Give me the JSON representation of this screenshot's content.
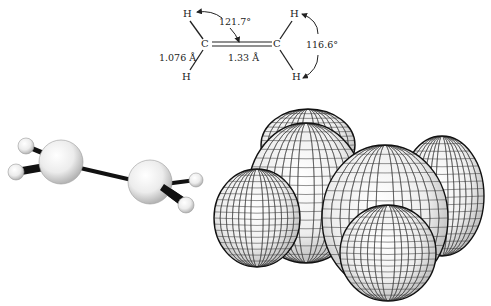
{
  "structural_formula": {
    "atoms": [
      {
        "id": "H1",
        "symbol": "H",
        "x": 183,
        "y": 9
      },
      {
        "id": "C1",
        "symbol": "C",
        "x": 201,
        "y": 39
      },
      {
        "id": "H2",
        "symbol": "H",
        "x": 182,
        "y": 72
      },
      {
        "id": "C2",
        "symbol": "C",
        "x": 273,
        "y": 39
      },
      {
        "id": "H3",
        "symbol": "H",
        "x": 290,
        "y": 9
      },
      {
        "id": "H4",
        "symbol": "H",
        "x": 292,
        "y": 72
      }
    ],
    "bond_angle_h_c_c": "121.7°",
    "bond_angle_h_c_h": "116.6°",
    "ch_bond_length": "1.076 Å",
    "cc_bond_length": "1.33 Å"
  },
  "ball_and_stick": {
    "carbons": [
      {
        "cx": 61,
        "cy": 162,
        "r": 22
      },
      {
        "cx": 150,
        "cy": 182,
        "r": 22
      }
    ],
    "hydrogens": [
      {
        "cx": 26,
        "cy": 146,
        "r": 8
      },
      {
        "cx": 16,
        "cy": 172,
        "r": 8
      },
      {
        "cx": 196,
        "cy": 180,
        "r": 7
      },
      {
        "cx": 186,
        "cy": 205,
        "r": 8
      }
    ]
  },
  "space_filling": {
    "atoms": [
      {
        "label": "H-back-top",
        "cx": 308,
        "cy": 145,
        "rx": 47,
        "ry": 36
      },
      {
        "label": "H-back-right",
        "cx": 442,
        "cy": 196,
        "rx": 42,
        "ry": 60
      },
      {
        "label": "C-left",
        "cx": 306,
        "cy": 193,
        "rx": 58,
        "ry": 70
      },
      {
        "label": "H-front-left",
        "cx": 257,
        "cy": 218,
        "rx": 43,
        "ry": 49
      },
      {
        "label": "C-right",
        "cx": 385,
        "cy": 218,
        "rx": 63,
        "ry": 73
      },
      {
        "label": "H-front-bottom",
        "cx": 388,
        "cy": 253,
        "rx": 48,
        "ry": 48
      }
    ]
  },
  "colors": {
    "ink": "#222222",
    "bond": "#111111",
    "atom_light": "#ffffff",
    "atom_shade": "#b8b8b8",
    "mesh": "#333333"
  }
}
